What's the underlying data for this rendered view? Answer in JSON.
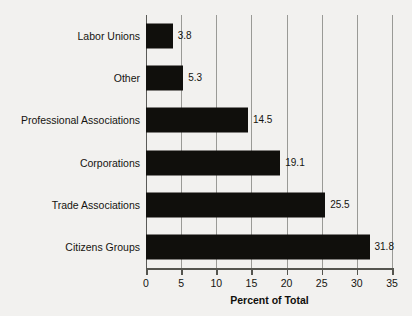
{
  "chart_data": {
    "type": "bar",
    "orientation": "horizontal",
    "title": "",
    "xlabel": "Percent of Total",
    "ylabel": "",
    "categories": [
      "Labor Unions",
      "Other",
      "Professional Associations",
      "Corporations",
      "Trade Associations",
      "Citizens Groups"
    ],
    "values": [
      3.8,
      5.3,
      14.5,
      19.1,
      25.5,
      31.8
    ],
    "value_labels": [
      "3.8",
      "5.3",
      "14.5",
      "19.1",
      "25.5",
      "31.8"
    ],
    "xlim": [
      0,
      35
    ],
    "xticks": [
      0,
      5,
      10,
      15,
      20,
      25,
      30,
      35
    ],
    "xtick_labels": [
      "0",
      "5",
      "10",
      "15",
      "20",
      "25",
      "30",
      "35"
    ],
    "grid": "vertical",
    "legend": "none",
    "bar_color": "#100f0c",
    "grid_color": "#9a9a96",
    "axis_color": "#55554f",
    "background_color": "#f2f1ef",
    "text_color": "#15140f"
  }
}
